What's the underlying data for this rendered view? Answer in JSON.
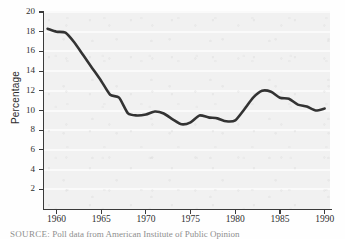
{
  "figure": {
    "background_color": "#fefefe",
    "panel_color": "#f1f1f1",
    "gridline_color": "#fafafa",
    "line_color": "#333333",
    "axis_color": "#3a3a3a"
  },
  "y_axis_title": "Percentage",
  "source_note": {
    "label": "SOURCE:",
    "text": "Poll data from American Institute of Public Opinion"
  },
  "bleed_text": {
    "line1": "",
    "line2": ""
  },
  "chart_data": {
    "type": "line",
    "title": "",
    "subtitle": "",
    "xlabel": "",
    "ylabel": "Percentage",
    "xlim": [
      1958.6,
      1990.6
    ],
    "ylim": [
      0,
      20
    ],
    "grid": true,
    "grid_axis": "y",
    "legend": false,
    "legend_position": "none",
    "x_ticks": [
      1960,
      1965,
      1970,
      1975,
      1980,
      1985,
      1990
    ],
    "x_tick_labels": [
      "1960",
      "1965",
      "1970",
      "1975",
      "1980",
      "1985",
      "1990"
    ],
    "y_ticks": [
      2,
      4,
      6,
      8,
      10,
      12,
      14,
      16,
      18,
      20
    ],
    "y_tick_labels": [
      "2",
      "4",
      "6",
      "8",
      "10",
      "12",
      "14",
      "16",
      "18",
      "20"
    ],
    "series": [
      {
        "name": "Percentage",
        "color": "#333333",
        "line_width": 2.6,
        "x": [
          1959,
          1960,
          1961,
          1962,
          1963,
          1964,
          1965,
          1966,
          1967,
          1968,
          1969,
          1970,
          1971,
          1972,
          1973,
          1974,
          1975,
          1976,
          1977,
          1978,
          1979,
          1980,
          1981,
          1982,
          1983,
          1984,
          1985,
          1986,
          1987,
          1988,
          1989,
          1990
        ],
        "values": [
          18.3,
          18.0,
          17.9,
          16.9,
          15.6,
          14.3,
          13.0,
          11.6,
          11.3,
          9.7,
          9.5,
          9.6,
          9.9,
          9.7,
          9.1,
          8.6,
          8.8,
          9.5,
          9.3,
          9.2,
          8.9,
          9.0,
          10.1,
          11.3,
          12.0,
          11.9,
          11.3,
          11.2,
          10.6,
          10.4,
          10.0,
          10.2
        ]
      }
    ]
  }
}
